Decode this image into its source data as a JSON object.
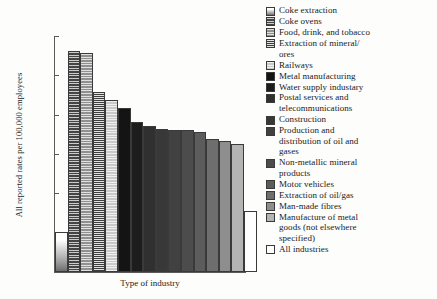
{
  "chart_data": {
    "type": "bar",
    "title": "",
    "xlabel": "Type of industry",
    "ylabel": "All reported rates per 100,000 employees",
    "ylim": [
      0,
      3000
    ],
    "yticks": [
      "0",
      "500",
      "1000",
      "1500",
      "2000",
      "2500",
      "3000"
    ],
    "grid": false,
    "legend_position": "right",
    "categories": [
      "Coke extraction",
      "Coke ovens",
      "Food, drink, and tobacco",
      "Extraction of mineral/ores",
      "Railways",
      "Metal manufacturing",
      "Water supply industary",
      "Postal services and telecommunications",
      "Construction",
      "Production and distribution of oil and gases",
      "Non-metallic mineral products",
      "Motor vehicles",
      "Extraction of oil/gas",
      "Man-made fibres",
      "Manufacture of metal goods (not elsewhere specified)",
      "All industries"
    ],
    "values": [
      510,
      2810,
      2780,
      2290,
      2190,
      2080,
      1910,
      1850,
      1820,
      1810,
      1800,
      1780,
      1690,
      1660,
      1630,
      770
    ]
  },
  "axes": {
    "y_title": "All reported rates per 100,000 employees",
    "x_title": "Type of industry",
    "y_ticks": [
      {
        "label": "3000",
        "value": 3000
      },
      {
        "label": "2500",
        "value": 2500
      },
      {
        "label": "2000",
        "value": 2000
      },
      {
        "label": "1500",
        "value": 1500
      },
      {
        "label": "1000",
        "value": 1000
      },
      {
        "label": "500",
        "value": 500
      },
      {
        "label": "0",
        "value": 0
      }
    ]
  },
  "legend": {
    "items": [
      {
        "label": "Coke extraction",
        "fill": "#f2f2f2",
        "pattern": "vgrad"
      },
      {
        "label": "Coke ovens",
        "fill": "#454545",
        "pattern": "hlines"
      },
      {
        "label": "Food, drink, and tobacco",
        "fill": "#909090",
        "pattern": "hlines"
      },
      {
        "label": "Extraction of mineral/ores",
        "fill": "#3c3c3c",
        "pattern": "hlines-dense"
      },
      {
        "label": "Railways",
        "fill": "#c9c9c9",
        "pattern": "hlines"
      },
      {
        "label": "Metal manufacturing",
        "fill": "#141414",
        "pattern": "solid"
      },
      {
        "label": "Water supply industary",
        "fill": "#1d1d1d",
        "pattern": "solid"
      },
      {
        "label": "Postal services and telecommunications",
        "fill": "#303030",
        "pattern": "solid"
      },
      {
        "label": "Construction",
        "fill": "#383838",
        "pattern": "solid"
      },
      {
        "label": "Production and distribution of oil and gases",
        "fill": "#414141",
        "pattern": "solid"
      },
      {
        "label": "Non-metallic mineral products",
        "fill": "#4c4c4c",
        "pattern": "solid"
      },
      {
        "label": "Motor vehicles",
        "fill": "#5c5c5c",
        "pattern": "solid"
      },
      {
        "label": "Extraction of oil/gas",
        "fill": "#6e6e6e",
        "pattern": "solid"
      },
      {
        "label": "Man-made fibres",
        "fill": "#8e8e8e",
        "pattern": "solid"
      },
      {
        "label": "Manufacture of metal goods (not elsewhere specified)",
        "fill": "#b4b4b4",
        "pattern": "solid"
      },
      {
        "label": "All industries",
        "fill": "#ffffff",
        "pattern": "solid"
      }
    ]
  },
  "legend_display": [
    "Coke extraction",
    "Coke ovens",
    "Food, drink, and tobacco",
    "Extraction of mineral/\nores",
    "Railways",
    "Metal manufacturing",
    "Water supply industary",
    "Postal services and\ntelecommunications",
    "Construction",
    "Production and\ndistribution of oil and\ngases",
    "Non-metallic mineral\nproducts",
    "Motor vehicles",
    "Extraction of oil/gas",
    "Man-made fibres",
    "Manufacture of metal\ngoods (not elsewhere\nspecified)",
    "All industries"
  ],
  "colors": {
    "axis": "#5a5a5a",
    "text": "#1a1a1a",
    "background": "#fdfdfc"
  }
}
